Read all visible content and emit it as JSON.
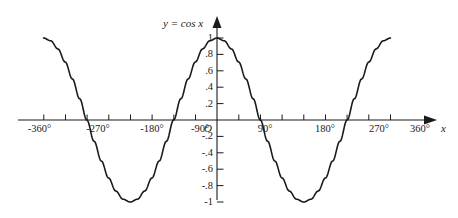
{
  "chart_data": {
    "type": "line",
    "title": "y = cos x",
    "xlabel": "x",
    "ylabel": "",
    "function": "cos",
    "xlim": [
      -360,
      360
    ],
    "ylim": [
      -1,
      1
    ],
    "x_unit": "degrees",
    "grid": false,
    "legend": null,
    "x_tick_labels": [
      "-360°",
      "-270°",
      "-180°",
      "-90°",
      "90°",
      "180°",
      "270°",
      "360°"
    ],
    "x_tick_values": [
      -360,
      -270,
      -180,
      -90,
      90,
      180,
      270,
      360
    ],
    "x_minor_tick_values": [
      -360,
      -315,
      -270,
      -225,
      -180,
      -135,
      -90,
      -45,
      45,
      90,
      135,
      180,
      225,
      270,
      315,
      360
    ],
    "y_tick_labels": [
      "1",
      ".8",
      ".6",
      ".4",
      ".2",
      "-.2",
      "-.4",
      "-.6",
      "-.8",
      "-1"
    ],
    "y_tick_values": [
      1,
      0.8,
      0.6,
      0.4,
      0.2,
      -0.2,
      -0.4,
      -0.6,
      -0.8,
      -1
    ],
    "origin_label": "O",
    "series": [
      {
        "name": "y = cos x",
        "x": [
          -360,
          -345,
          -330,
          -315,
          -300,
          -285,
          -270,
          -255,
          -240,
          -225,
          -210,
          -195,
          -180,
          -165,
          -150,
          -135,
          -120,
          -105,
          -90,
          -75,
          -60,
          -45,
          -30,
          -15,
          0,
          15,
          30,
          45,
          60,
          75,
          90,
          105,
          120,
          135,
          150,
          165,
          180,
          195,
          210,
          225,
          240,
          255,
          270,
          285,
          300,
          315,
          330,
          345,
          360
        ],
        "values": [
          1.0,
          0.966,
          0.866,
          0.707,
          0.5,
          0.259,
          0.0,
          -0.259,
          -0.5,
          -0.707,
          -0.866,
          -0.966,
          -1.0,
          -0.966,
          -0.866,
          -0.707,
          -0.5,
          -0.259,
          0.0,
          0.259,
          0.5,
          0.707,
          0.866,
          0.966,
          1.0,
          0.966,
          0.866,
          0.707,
          0.5,
          0.259,
          0.0,
          -0.259,
          -0.5,
          -0.707,
          -0.866,
          -0.966,
          -1.0,
          -0.966,
          -0.866,
          -0.707,
          -0.5,
          -0.259,
          0.0,
          0.259,
          0.5,
          0.707,
          0.866,
          0.966,
          1.0
        ]
      }
    ],
    "key_points": {
      "maxima_x": [
        -360,
        0,
        360
      ],
      "minima_x": [
        -180,
        180
      ],
      "zeros_x": [
        -270,
        -90,
        90,
        270
      ]
    },
    "colors": {
      "curve": "#1a1a1a",
      "axis": "#1a1a1a",
      "text": "#1a1a1a",
      "background": "#ffffff"
    }
  }
}
